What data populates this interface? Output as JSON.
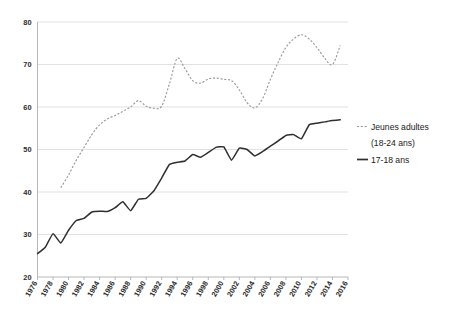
{
  "chart_data": {
    "type": "line",
    "title": "",
    "subtitle": "",
    "xlabel": "",
    "ylabel": "",
    "xlim": [
      1976,
      2016
    ],
    "ylim": [
      20,
      80
    ],
    "grid": "horizontal",
    "legend_position": "right",
    "y_ticks": [
      "20",
      "30",
      "40",
      "50",
      "60",
      "70",
      "80"
    ],
    "y_tick_values": [
      20,
      30,
      40,
      50,
      60,
      70,
      80
    ],
    "x_ticks": [
      "1976",
      "1978",
      "1980",
      "1982",
      "1984",
      "1986",
      "1988",
      "1990",
      "1992",
      "1994",
      "1996",
      "1998",
      "2000",
      "2002",
      "2004",
      "2006",
      "2008",
      "2010",
      "2012",
      "2014",
      "2016"
    ],
    "x_tick_values": [
      1976,
      1978,
      1980,
      1982,
      1984,
      1986,
      1988,
      1990,
      1992,
      1994,
      1996,
      1998,
      2000,
      2002,
      2004,
      2006,
      2008,
      2010,
      2012,
      2014,
      2016
    ],
    "series": [
      {
        "name": "Jeunes adultes (18-24 ans)",
        "style": "dashed",
        "color": "#9a9a9a",
        "x": [
          1979,
          1980,
          1981,
          1982,
          1983,
          1984,
          1985,
          1986,
          1987,
          1988,
          1989,
          1990,
          1991,
          1992,
          1993,
          1994,
          1995,
          1996,
          1997,
          1998,
          1999,
          2000,
          2001,
          2002,
          2003,
          2004,
          2005,
          2006,
          2007,
          2008,
          2009,
          2010,
          2011,
          2012,
          2013,
          2014,
          2015
        ],
        "values": [
          41.0,
          44.0,
          47.5,
          50.5,
          53.5,
          55.8,
          57.2,
          58.0,
          59.0,
          60.0,
          61.5,
          60.2,
          59.7,
          60.2,
          65.5,
          71.4,
          69.0,
          66.2,
          65.6,
          66.6,
          66.8,
          66.5,
          66.2,
          64.0,
          61.0,
          59.8,
          62.0,
          66.5,
          70.5,
          74.0,
          76.0,
          77.0,
          76.0,
          74.0,
          71.5,
          70.0,
          74.5
        ]
      },
      {
        "name": "17-18 ans",
        "style": "solid",
        "color": "#2f2f2f",
        "x": [
          1976,
          1977,
          1978,
          1979,
          1980,
          1981,
          1982,
          1983,
          1984,
          1985,
          1986,
          1987,
          1988,
          1989,
          1990,
          1991,
          1992,
          1993,
          1994,
          1995,
          1996,
          1997,
          1998,
          1999,
          2000,
          2001,
          2002,
          2003,
          2004,
          2005,
          2006,
          2007,
          2008,
          2009,
          2010,
          2011,
          2012,
          2013,
          2014,
          2015
        ],
        "values": [
          25.5,
          27.0,
          30.2,
          28.0,
          31.0,
          33.3,
          33.8,
          35.3,
          35.5,
          35.4,
          36.3,
          37.7,
          35.6,
          38.3,
          38.5,
          40.3,
          43.3,
          46.5,
          47.0,
          47.3,
          48.8,
          48.2,
          49.3,
          50.5,
          50.6,
          47.5,
          50.3,
          50.0,
          48.5,
          49.5,
          50.8,
          52.0,
          53.3,
          53.5,
          52.5,
          55.8,
          56.2,
          56.5,
          56.8,
          57.0
        ]
      }
    ]
  },
  "legend": {
    "entries": [
      {
        "label_line1": "Jeunes adultes",
        "label_line2": "(18-24 ans)",
        "style": "dashed"
      },
      {
        "label_line1": "17-18 ans",
        "label_line2": "",
        "style": "solid"
      }
    ]
  },
  "colors": {
    "background": "#ffffff",
    "gridline": "#d9d9d9",
    "axis": "#b0b0b0",
    "dashed_series": "#9a9a9a",
    "solid_series": "#2f2f2f",
    "text": "#1a1a1a"
  }
}
